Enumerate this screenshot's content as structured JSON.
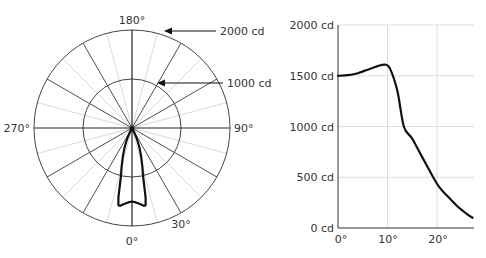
{
  "chart_data": [
    {
      "type": "polar",
      "title": "",
      "angle_labels": [
        {
          "label": "180°",
          "angle": 180
        },
        {
          "label": "90°",
          "angle": 90
        },
        {
          "label": "270°",
          "angle": 270
        },
        {
          "label": "0°",
          "angle": 0
        },
        {
          "label": "30°",
          "angle": 30
        }
      ],
      "radial_rings": [
        {
          "label": "1000 cd",
          "value": 1000
        },
        {
          "label": "2000 cd",
          "value": 2000
        }
      ],
      "rlim": [
        0,
        2000
      ],
      "major_spoke_step_deg": 30,
      "minor_spoke_step_deg": 15,
      "series": [
        {
          "name": "luminous intensity",
          "theta_deg": [
            0,
            3,
            6,
            9,
            10,
            11,
            12,
            13,
            15,
            18,
            21,
            24,
            27
          ],
          "r_cd": [
            1500,
            1520,
            1560,
            1610,
            1600,
            1450,
            1200,
            1000,
            820,
            600,
            420,
            250,
            100
          ]
        }
      ]
    },
    {
      "type": "line",
      "title": "",
      "xlabel": "",
      "ylabel": "",
      "x_ticks": [
        "0°",
        "10°",
        "20°"
      ],
      "y_ticks": [
        "0 cd",
        "500 cd",
        "1000 cd",
        "1500 cd",
        "2000 cd"
      ],
      "xlim": [
        0,
        27.5
      ],
      "ylim": [
        0,
        2000
      ],
      "grid": true,
      "series": [
        {
          "name": "luminous intensity",
          "x": [
            0,
            2,
            4,
            6,
            8,
            9.5,
            10.5,
            12,
            13.3,
            15,
            17,
            19,
            20.5,
            22,
            24,
            26,
            27.2
          ],
          "y": [
            1500,
            1505,
            1525,
            1560,
            1595,
            1610,
            1570,
            1350,
            1000,
            880,
            700,
            520,
            400,
            320,
            220,
            140,
            100
          ]
        }
      ]
    }
  ],
  "polar": {
    "labels": {
      "top": "180°",
      "right": "90°",
      "left": "270°",
      "bottom": "0°",
      "thirty": "30°"
    },
    "callouts": {
      "outer": "2000 cd",
      "inner": "1000 cd"
    }
  },
  "cartesian": {
    "y_labels": [
      "2000 cd",
      "1500 cd",
      "1000 cd",
      "500 cd",
      "0 cd"
    ],
    "x_labels": [
      "0°",
      "10°",
      "20°"
    ]
  },
  "colors": {
    "curve": "#111111",
    "major_grid": "#333333",
    "minor_grid": "#cccccc",
    "text": "#333333"
  }
}
